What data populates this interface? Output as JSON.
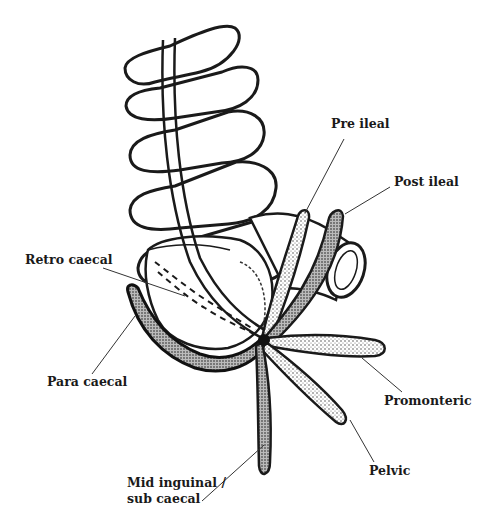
{
  "figure": {
    "colors": {
      "ink": "#1a1a1a",
      "background": "#ffffff",
      "shade": "#555555"
    }
  },
  "labels": {
    "pre_ileal": "Pre ileal",
    "post_ileal": "Post ileal",
    "retro_caecal": "Retro caecal",
    "para_caecal": "Para caecal",
    "promonteric": "Promonteric",
    "pelvic": "Pelvic",
    "mid_inguinal_line1": "Mid inguinal /",
    "mid_inguinal_line2": "sub caecal"
  }
}
